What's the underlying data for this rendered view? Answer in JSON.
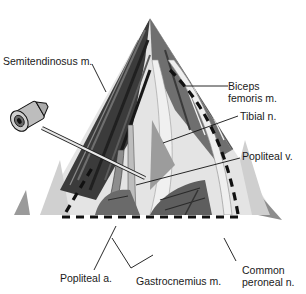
{
  "figure": {
    "colors": {
      "background": "#ffffff",
      "muscle_dark": "#3a3a3a",
      "muscle_mid": "#7a7a7a",
      "muscle_light": "#b8b8b8",
      "tissue_pale": "#e2e2e2",
      "outline": "#111111",
      "dashed_line": "#111111"
    }
  },
  "labels": {
    "semitendinosus": "Semitendinosus m.",
    "biceps_line1": "Biceps",
    "biceps_line2": "femoris m.",
    "tibial": "Tibial n.",
    "popliteal_v": "Popliteal v.",
    "popliteal_a": "Popliteal a.",
    "gastrocnemius": "Gastrocnemius m.",
    "common_line1": "Common",
    "common_line2": "peroneal n."
  }
}
